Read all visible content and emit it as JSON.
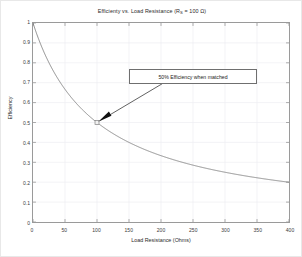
{
  "chart_data": {
    "type": "line",
    "title_main": "Efficienty vs. Load Resistance (R",
    "title_sub": "S",
    "title_tail": " = 100 Ω)",
    "xlabel": "Load Resistance (Ohms)",
    "ylabel": "Efficiency",
    "xlim": [
      0,
      400
    ],
    "ylim": [
      0,
      1
    ],
    "xticks": [
      0,
      50,
      100,
      150,
      200,
      250,
      300,
      350,
      400
    ],
    "xtick_labels": [
      "0",
      "50",
      "100",
      "150",
      "200",
      "250",
      "300",
      "350",
      "400"
    ],
    "yticks": [
      0,
      0.1,
      0.2,
      0.3,
      0.4,
      0.5,
      0.6,
      0.7,
      0.8,
      0.9,
      1
    ],
    "ytick_labels": [
      "0",
      "0.1",
      "0.2",
      "0.3",
      "0.4",
      "0.5",
      "0.6",
      "0.7",
      "0.8",
      "0.9",
      "1"
    ],
    "grid": true,
    "legend": null,
    "line_color": "#707070",
    "series": [
      {
        "name": "Efficiency",
        "formula": "eta = Rs / (Rl + Rs), Rs = 100",
        "x": [
          0,
          5,
          10,
          15,
          20,
          25,
          30,
          40,
          50,
          60,
          70,
          80,
          90,
          100,
          110,
          120,
          130,
          140,
          150,
          160,
          170,
          180,
          190,
          200,
          220,
          240,
          260,
          280,
          300,
          320,
          340,
          360,
          380,
          400
        ],
        "y": [
          1.0,
          0.952,
          0.909,
          0.87,
          0.833,
          0.8,
          0.769,
          0.714,
          0.667,
          0.625,
          0.588,
          0.556,
          0.526,
          0.5,
          0.476,
          0.455,
          0.435,
          0.417,
          0.4,
          0.385,
          0.37,
          0.357,
          0.345,
          0.333,
          0.313,
          0.294,
          0.278,
          0.263,
          0.25,
          0.238,
          0.227,
          0.217,
          0.208,
          0.2
        ]
      }
    ],
    "markers": [
      {
        "x": 100,
        "y": 0.5,
        "label": "matched point",
        "shape": "square"
      }
    ],
    "annotations": [
      {
        "text": "50% Efficiency when matched",
        "box_x": 220,
        "box_y": 0.715,
        "arrow_from_x": 202,
        "arrow_from_y": 0.695,
        "arrow_to_x": 100,
        "arrow_to_y": 0.5
      }
    ]
  }
}
